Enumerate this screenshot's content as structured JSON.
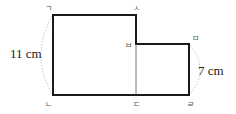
{
  "diagram": {
    "type": "composite-rectangle",
    "vertices": [
      {
        "id": "giyeok",
        "label": "ㄱ"
      },
      {
        "id": "nieun",
        "label": "ㄴ"
      },
      {
        "id": "digeut",
        "label": "ㄷ"
      },
      {
        "id": "rieul",
        "label": "ㄹ"
      },
      {
        "id": "mieum",
        "label": "ㅁ"
      },
      {
        "id": "bieup",
        "label": "ㅂ"
      },
      {
        "id": "siot",
        "label": "ㅅ"
      }
    ],
    "measurements": {
      "left_side": "11 cm",
      "right_side": "7 cm"
    },
    "colors": {
      "outline": "#1a1a1a",
      "divider": "#555555",
      "arc": "#aaaaaa"
    }
  }
}
